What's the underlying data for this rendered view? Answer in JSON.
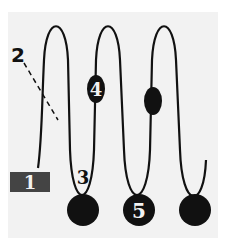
{
  "colors": {
    "background": "#ffffff",
    "panel": "#f2f2f2",
    "line": "#111111",
    "marker": "#111111",
    "label_box": "#444444",
    "label_text_light": "#f2f2f2",
    "label_text_dark": "#111111"
  },
  "labels": {
    "l1": "1",
    "l2": "2",
    "l3": "3",
    "l4": "4",
    "l5": "5"
  },
  "elements": [
    {
      "id": "1",
      "type": "boxed-label",
      "description": "start of coiled line"
    },
    {
      "id": "2",
      "type": "leader-label",
      "description": "dashed leader pointing to first loop"
    },
    {
      "id": "3",
      "type": "plain-label",
      "description": "bottom of first loop"
    },
    {
      "id": "4",
      "type": "oval-marker-labeled",
      "description": "oval on second loop"
    },
    {
      "id": "5",
      "type": "circle-marker-labeled",
      "description": "bottom bead"
    }
  ]
}
